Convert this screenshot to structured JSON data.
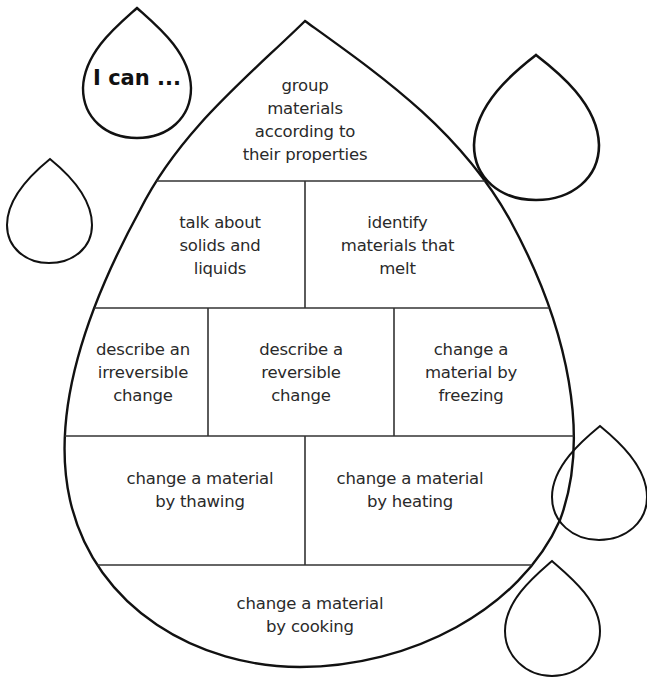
{
  "worksheet": {
    "heading": "I can ...",
    "cells": {
      "row1": "group\nmaterials\naccording to\ntheir properties",
      "row2_left": "talk about\nsolids and\nliquids",
      "row2_right": "identify\nmaterials that\nmelt",
      "row3_left": "describe an\nirreversible\nchange",
      "row3_middle": "describe a\nreversible\nchange",
      "row3_right": "change a\nmaterial by\nfreezing",
      "row4_left": "change a material\nby thawing",
      "row4_right": "change a material\nby heating",
      "row5": "change a material\nby cooking"
    },
    "blank_drops": 4,
    "colors": {
      "stroke": "#111111",
      "background": "#ffffff",
      "text": "#2a2a2a"
    }
  }
}
